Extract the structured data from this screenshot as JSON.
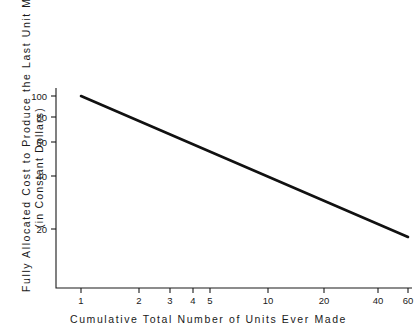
{
  "chart_data": {
    "type": "line",
    "title": "",
    "xlabel": "Cumulative  Total  Number  of  Units  Ever  Made",
    "ylabel": "Fully  Allocated  Cost  to  Produce  the  Last  Unit  Made",
    "ylabel_sub": "(in  Constant  Dollars)",
    "xscale": "log",
    "yscale": "log",
    "xlim": [
      1,
      60
    ],
    "ylim": [
      14,
      110
    ],
    "grid": false,
    "legend": null,
    "xticks": [
      1,
      2,
      3,
      4,
      5,
      10,
      20,
      40,
      60
    ],
    "xtick_labels": [
      "1",
      "2",
      "3",
      "4",
      "5",
      "10",
      "20",
      "40",
      "60"
    ],
    "yticks": [
      20,
      40,
      60,
      80,
      100
    ],
    "ytick_labels": [
      "20",
      "40",
      "60",
      "80",
      "100"
    ],
    "series": [
      {
        "name": "experience curve",
        "color": "#111111",
        "x": [
          1,
          2,
          3,
          4,
          5,
          10,
          20,
          40,
          60
        ],
        "y": [
          100,
          79,
          69,
          63,
          58,
          46,
          36,
          29,
          25
        ]
      }
    ],
    "annotations": []
  },
  "axes": {
    "x_tick_positions_px": [
      81,
      139,
      170,
      193,
      210,
      268,
      324,
      378,
      408
    ],
    "y_tick_positions_px": [
      229,
      176,
      142,
      117,
      96
    ],
    "origin_px": [
      56,
      288
    ],
    "x_axis_end_px": [
      412,
      288
    ],
    "y_axis_top_px": [
      56,
      88
    ],
    "line_start_px": [
      81,
      96
    ],
    "line_end_px": [
      408,
      237
    ]
  },
  "colors": {
    "background": "#ffffff",
    "axis": "#1a1a1a",
    "line": "#111111",
    "text": "#1a1a1a"
  }
}
